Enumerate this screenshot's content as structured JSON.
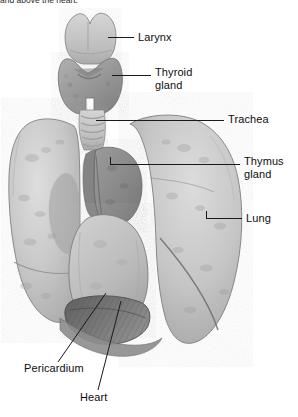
{
  "figure": {
    "caption_clipped": "and above the heart.",
    "style": "grayscale photographic plate",
    "background_color": "#ffffff"
  },
  "palette": {
    "lung_light": "#cdcdcd",
    "lung_mid": "#bdbdbd",
    "lung_shadow": "#a6a6a6",
    "thymus": "#8d8d8d",
    "thyroid": "#9a9a9a",
    "larynx": "#c2c2c2",
    "trachea": "#bcbcbc",
    "pericardium": "#b9b9b9",
    "diaphragm_dark": "#707070",
    "outline": "#6a6a6a",
    "leader_line": "#1a1a1a",
    "label_text": "#0d0d0d"
  },
  "labels": [
    {
      "id": "larynx",
      "text": "Larynx",
      "lines": [
        "Larynx"
      ],
      "text_x": 138,
      "text_y": 31,
      "leader": {
        "x1": 108,
        "y1": 37,
        "x2": 134,
        "y2": 37
      }
    },
    {
      "id": "thyroid-gland",
      "text": "Thyroid gland",
      "lines": [
        "Thyroid",
        "gland"
      ],
      "text_x": 155,
      "text_y": 66,
      "leader": {
        "x1": 112,
        "y1": 75,
        "x2": 151,
        "y2": 75
      }
    },
    {
      "id": "trachea",
      "text": "Trachea",
      "lines": [
        "Trachea"
      ],
      "text_x": 228,
      "text_y": 113,
      "leader": {
        "x1": 96,
        "y1": 120,
        "x2": 224,
        "y2": 120
      }
    },
    {
      "id": "thymus-gland",
      "text": "Thymus gland",
      "lines": [
        "Thymus",
        "gland"
      ],
      "text_x": 244,
      "text_y": 155,
      "leader": {
        "x1": 110,
        "y1": 164,
        "x2": 240,
        "y2": 164
      }
    },
    {
      "id": "lung",
      "text": "Lung",
      "lines": [
        "Lung"
      ],
      "text_x": 246,
      "text_y": 212,
      "leader": {
        "x1": 206,
        "y1": 218,
        "x2": 242,
        "y2": 218
      }
    },
    {
      "id": "pericardium",
      "text": "Pericardium",
      "lines": [
        "Pericardium"
      ],
      "text_x": 24,
      "text_y": 368,
      "leader": {
        "x1": 106,
        "y1": 293,
        "x2": 58,
        "y2": 362
      }
    },
    {
      "id": "heart",
      "text": "Heart",
      "lines": [
        "Heart"
      ],
      "text_x": 80,
      "text_y": 397,
      "leader": {
        "x1": 121,
        "y1": 301,
        "x2": 98,
        "y2": 390
      }
    }
  ],
  "structures": [
    {
      "id": "larynx",
      "name": "Larynx"
    },
    {
      "id": "thyroid-gland",
      "name": "Thyroid gland"
    },
    {
      "id": "trachea",
      "name": "Trachea"
    },
    {
      "id": "thymus-gland",
      "name": "Thymus gland"
    },
    {
      "id": "left-lung",
      "name": "Lung (left)"
    },
    {
      "id": "right-lung",
      "name": "Lung (right)"
    },
    {
      "id": "pericardium",
      "name": "Pericardium"
    },
    {
      "id": "heart",
      "name": "Heart"
    },
    {
      "id": "diaphragm",
      "name": "Diaphragm"
    }
  ]
}
